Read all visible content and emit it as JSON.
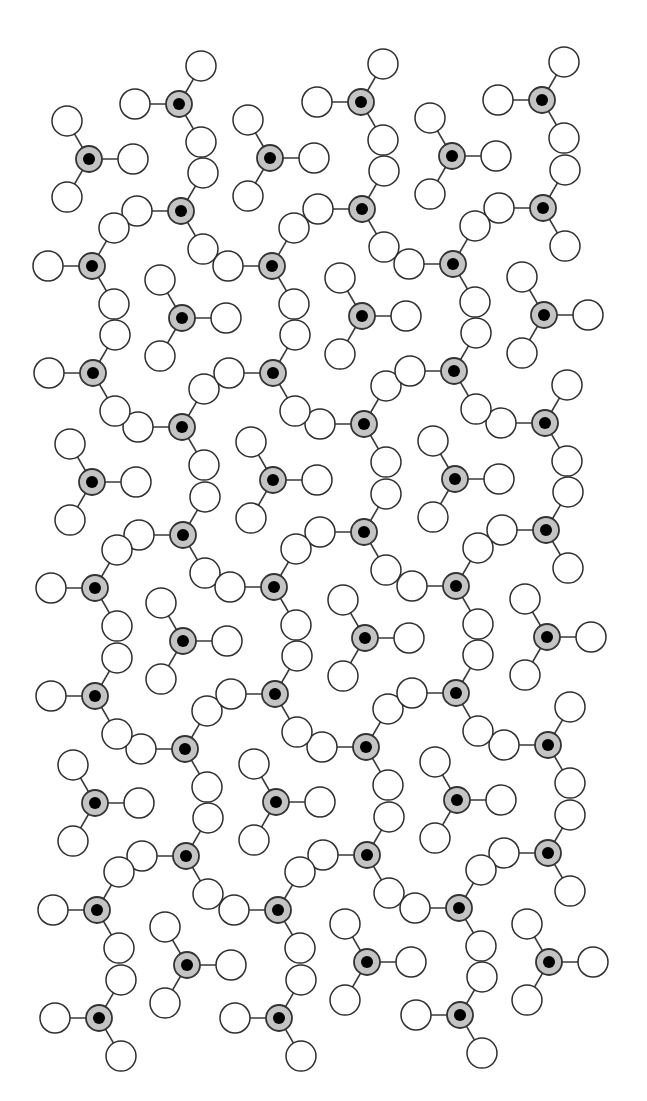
{
  "diagram": {
    "type": "crystal-structure-packing",
    "bond_length": 44,
    "ligand_radius": 15,
    "center_radius": 13,
    "core_radius": 6,
    "colors": {
      "background": "#ffffff",
      "ligand_fill": "#ffffff",
      "outline": "#2e2e2e",
      "center_fill": "#c4c4c4",
      "core_fill": "#000000"
    },
    "motifs": {
      "chain": [
        180,
        300,
        60
      ],
      "Y": [
        240,
        0,
        120
      ]
    },
    "units": [
      {
        "x": 179,
        "y": 104,
        "motif": "chain"
      },
      {
        "x": 181,
        "y": 211,
        "motif": "chain"
      },
      {
        "x": 182,
        "y": 318,
        "motif": "Y"
      },
      {
        "x": 182,
        "y": 427,
        "motif": "chain"
      },
      {
        "x": 183,
        "y": 535,
        "motif": "chain"
      },
      {
        "x": 183,
        "y": 641,
        "motif": "Y"
      },
      {
        "x": 185,
        "y": 749,
        "motif": "chain"
      },
      {
        "x": 186,
        "y": 856,
        "motif": "chain"
      },
      {
        "x": 187,
        "y": 965,
        "motif": "Y"
      },
      {
        "x": 361,
        "y": 102,
        "motif": "chain"
      },
      {
        "x": 362,
        "y": 209,
        "motif": "chain"
      },
      {
        "x": 362,
        "y": 316,
        "motif": "Y"
      },
      {
        "x": 364,
        "y": 424,
        "motif": "chain"
      },
      {
        "x": 364,
        "y": 532,
        "motif": "chain"
      },
      {
        "x": 365,
        "y": 638,
        "motif": "Y"
      },
      {
        "x": 366,
        "y": 747,
        "motif": "chain"
      },
      {
        "x": 367,
        "y": 855,
        "motif": "chain"
      },
      {
        "x": 367,
        "y": 962,
        "motif": "Y"
      },
      {
        "x": 542,
        "y": 100,
        "motif": "chain"
      },
      {
        "x": 543,
        "y": 208,
        "motif": "chain"
      },
      {
        "x": 544,
        "y": 315,
        "motif": "Y"
      },
      {
        "x": 545,
        "y": 423,
        "motif": "chain"
      },
      {
        "x": 546,
        "y": 530,
        "motif": "chain"
      },
      {
        "x": 547,
        "y": 637,
        "motif": "Y"
      },
      {
        "x": 548,
        "y": 745,
        "motif": "chain"
      },
      {
        "x": 548,
        "y": 853,
        "motif": "chain"
      },
      {
        "x": 549,
        "y": 962,
        "motif": "Y"
      },
      {
        "x": 89,
        "y": 159,
        "motif": "Y"
      },
      {
        "x": 92,
        "y": 266,
        "motif": "chain"
      },
      {
        "x": 93,
        "y": 373,
        "motif": "chain"
      },
      {
        "x": 92,
        "y": 482,
        "motif": "Y"
      },
      {
        "x": 95,
        "y": 588,
        "motif": "chain"
      },
      {
        "x": 95,
        "y": 696,
        "motif": "chain"
      },
      {
        "x": 95,
        "y": 803,
        "motif": "Y"
      },
      {
        "x": 97,
        "y": 910,
        "motif": "chain"
      },
      {
        "x": 99,
        "y": 1018,
        "motif": "chain"
      },
      {
        "x": 270,
        "y": 158,
        "motif": "Y"
      },
      {
        "x": 272,
        "y": 266,
        "motif": "chain"
      },
      {
        "x": 273,
        "y": 373,
        "motif": "chain"
      },
      {
        "x": 273,
        "y": 480,
        "motif": "Y"
      },
      {
        "x": 274,
        "y": 587,
        "motif": "chain"
      },
      {
        "x": 275,
        "y": 694,
        "motif": "chain"
      },
      {
        "x": 276,
        "y": 802,
        "motif": "Y"
      },
      {
        "x": 278,
        "y": 910,
        "motif": "chain"
      },
      {
        "x": 279,
        "y": 1018,
        "motif": "chain"
      },
      {
        "x": 452,
        "y": 156,
        "motif": "Y"
      },
      {
        "x": 453,
        "y": 264,
        "motif": "chain"
      },
      {
        "x": 454,
        "y": 371,
        "motif": "chain"
      },
      {
        "x": 455,
        "y": 479,
        "motif": "Y"
      },
      {
        "x": 456,
        "y": 586,
        "motif": "chain"
      },
      {
        "x": 456,
        "y": 693,
        "motif": "chain"
      },
      {
        "x": 457,
        "y": 800,
        "motif": "Y"
      },
      {
        "x": 459,
        "y": 908,
        "motif": "chain"
      },
      {
        "x": 460,
        "y": 1015,
        "motif": "chain"
      }
    ]
  }
}
